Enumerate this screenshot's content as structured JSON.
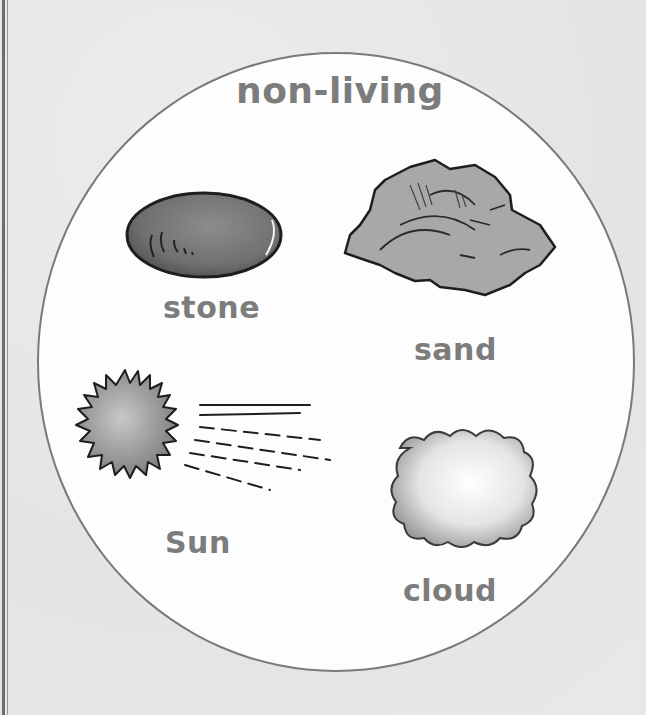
{
  "diagram": {
    "title": "non-living",
    "items": [
      {
        "label": "stone",
        "icon": "stone-icon"
      },
      {
        "label": "sand",
        "icon": "sand-rock-icon"
      },
      {
        "label": "Sun",
        "icon": "sun-icon"
      },
      {
        "label": "cloud",
        "icon": "cloud-icon"
      }
    ],
    "colors": {
      "circle_fill": "#fdfdfd",
      "circle_border": "#7a7a7a",
      "label_text": "#7c7c7c",
      "page_background": "#e9e9e9"
    }
  }
}
